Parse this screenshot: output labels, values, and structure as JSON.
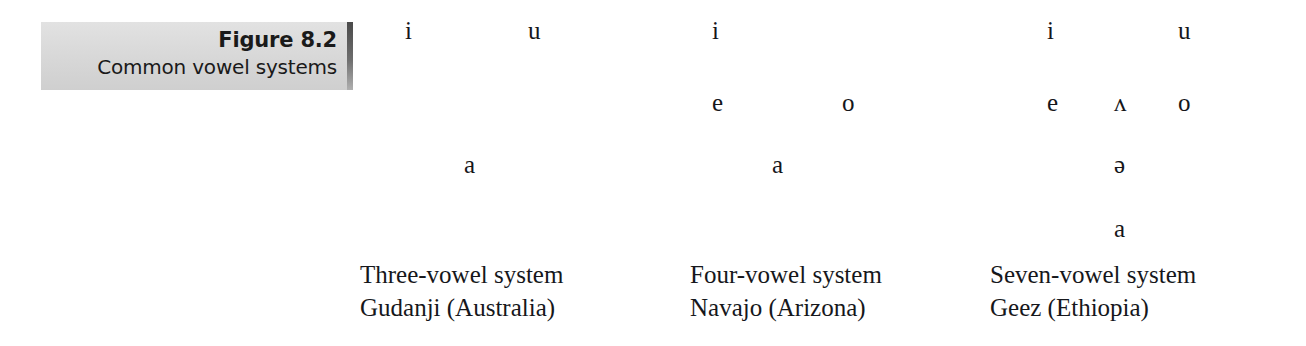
{
  "figure": {
    "number_label": "Figure 8.2",
    "title": "Common vowel systems"
  },
  "chart_data": {
    "type": "table",
    "title": "Common vowel systems",
    "columns": [
      {
        "id": "three-vowel",
        "caption_line1": "Three-vowel system",
        "caption_line2": "Gudanji (Australia)",
        "vowel_count": 3,
        "vowels": [
          {
            "symbol": "i",
            "x": 45,
            "y": 18,
            "height": "high",
            "backness": "front"
          },
          {
            "symbol": "u",
            "x": 168,
            "y": 18,
            "height": "high",
            "backness": "back"
          },
          {
            "symbol": "a",
            "x": 104,
            "y": 152,
            "height": "low",
            "backness": "central"
          }
        ]
      },
      {
        "id": "four-vowel",
        "caption_line1": "Four-vowel system",
        "caption_line2": "Navajo (Arizona)",
        "vowel_count": 4,
        "vowels": [
          {
            "symbol": "i",
            "x": 22,
            "y": 18,
            "height": "high",
            "backness": "front"
          },
          {
            "symbol": "e",
            "x": 22,
            "y": 90,
            "height": "mid",
            "backness": "front"
          },
          {
            "symbol": "o",
            "x": 152,
            "y": 90,
            "height": "mid",
            "backness": "back"
          },
          {
            "symbol": "a",
            "x": 82,
            "y": 152,
            "height": "low",
            "backness": "central"
          }
        ]
      },
      {
        "id": "seven-vowel",
        "caption_line1": "Seven-vowel system",
        "caption_line2": "Geez (Ethiopia)",
        "vowel_count": 7,
        "vowels": [
          {
            "symbol": "i",
            "x": 57,
            "y": 18,
            "height": "high",
            "backness": "front"
          },
          {
            "symbol": "u",
            "x": 188,
            "y": 18,
            "height": "high",
            "backness": "back"
          },
          {
            "symbol": "e",
            "x": 57,
            "y": 90,
            "height": "mid",
            "backness": "front"
          },
          {
            "symbol": "ʌ",
            "x": 124,
            "y": 90,
            "height": "mid",
            "backness": "central"
          },
          {
            "symbol": "o",
            "x": 188,
            "y": 90,
            "height": "mid",
            "backness": "back"
          },
          {
            "symbol": "ə",
            "x": 124,
            "y": 152,
            "height": "mid-central",
            "backness": "central"
          },
          {
            "symbol": "a",
            "x": 124,
            "y": 216,
            "height": "low",
            "backness": "central"
          }
        ]
      }
    ]
  },
  "colors": {
    "background": "#ffffff",
    "text": "#15161a",
    "plaque_light": "#e2e2e2",
    "plaque_dark": "#cfcfcf",
    "plaque_edge": "#4a4a4a"
  }
}
